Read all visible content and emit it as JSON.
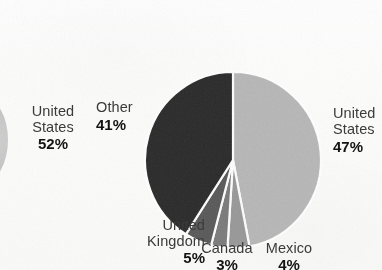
{
  "figure": {
    "background_color": "#fdfdfc",
    "text_color": "#3b3b3b",
    "emphasis_color": "#131313"
  },
  "adjacent_figure": {
    "name": "partial-pie-left",
    "label": {
      "line1": "United",
      "line2": "States",
      "percent": "52%"
    }
  },
  "chart_data": {
    "type": "pie",
    "title": "",
    "subtitle": "",
    "xlabel": "",
    "ylabel": "",
    "legend_position": "none",
    "labels_position": "outside",
    "start_angle_deg": 0,
    "direction": "clockwise",
    "units": "percent",
    "total": 100,
    "categories": [
      "United States",
      "Mexico",
      "Canada",
      "United Kingdom",
      "Other"
    ],
    "values": [
      47,
      4,
      3,
      5,
      41
    ],
    "colors": [
      "#b9b9b9",
      "#9a9a9a",
      "#7c7c7c",
      "#5a5a5a",
      "#2b2b2b"
    ],
    "separator_color": "#ffffff",
    "slices": [
      {
        "name": "United States",
        "value": 47,
        "label_line1": "United",
        "label_line2": "States",
        "percent_text": "47%",
        "color": "#b9b9b9"
      },
      {
        "name": "Mexico",
        "value": 4,
        "label_line1": "Mexico",
        "label_line2": "",
        "percent_text": "4%",
        "color": "#9a9a9a"
      },
      {
        "name": "Canada",
        "value": 3,
        "label_line1": "Canada",
        "label_line2": "",
        "percent_text": "3%",
        "color": "#7c7c7c"
      },
      {
        "name": "United Kingdom",
        "value": 5,
        "label_line1": "United",
        "label_line2": "Kingdom",
        "percent_text": "5%",
        "color": "#5a5a5a"
      },
      {
        "name": "Other",
        "value": 41,
        "label_line1": "Other",
        "label_line2": "",
        "percent_text": "41%",
        "color": "#2b2b2b"
      }
    ]
  }
}
